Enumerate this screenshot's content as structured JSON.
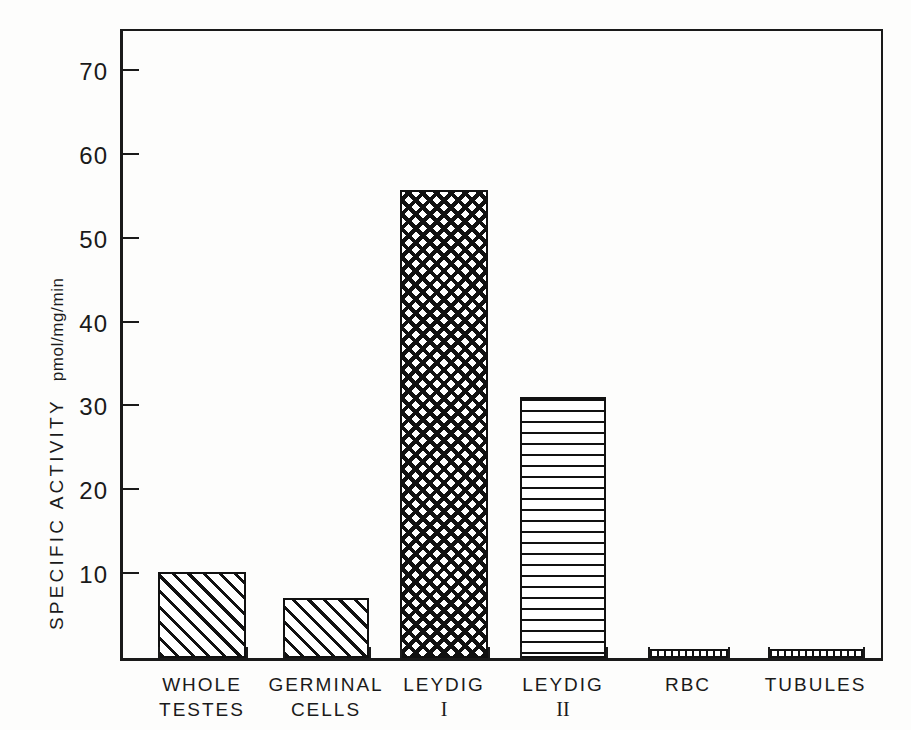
{
  "figure": {
    "width": 911,
    "height": 730,
    "background": "#ffffff",
    "ink_color": "#111111"
  },
  "chart_data": {
    "type": "bar",
    "title": "",
    "xlabel": "",
    "ylabel": "SPECIFIC ACTIVITY pmol/mg/min",
    "ylabel_main": "SPECIFIC  ACTIVITY",
    "ylabel_units": "pmol/mg/min",
    "categories": [
      "WHOLE TESTES",
      "GERMINAL CELLS",
      "LEYDIG I",
      "LEYDIG II",
      "RBC",
      "TUBULES"
    ],
    "category_lines": [
      [
        "WHOLE",
        "TESTES"
      ],
      [
        "GERMINAL",
        "CELLS"
      ],
      [
        "LEYDIG",
        "I"
      ],
      [
        "LEYDIG",
        "II"
      ],
      [
        "RBC",
        ""
      ],
      [
        "TUBULES",
        ""
      ]
    ],
    "values": [
      10.2,
      7.1,
      55.8,
      31.1,
      1.0,
      0.9
    ],
    "ylim": [
      0,
      75
    ],
    "yticks": [
      10,
      20,
      30,
      40,
      50,
      60,
      70
    ],
    "yticklabels": [
      "10",
      "20",
      "30",
      "40",
      "50",
      "60",
      "70"
    ],
    "grid": false,
    "legend": "none",
    "bar_patterns": [
      "diagonal-hatch",
      "diagonal-hatch",
      "cross-hatch",
      "horizontal-hatch",
      "vertical-hatch",
      "vertical-hatch"
    ]
  }
}
